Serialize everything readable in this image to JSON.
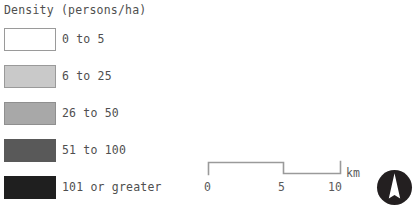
{
  "legend": {
    "title": "Density (persons/ha)",
    "classes": [
      {
        "label": "0 to 5",
        "color": "#ffffff",
        "border": "#9a9a9a"
      },
      {
        "label": "6 to 25",
        "color": "#c9c9c9",
        "border": "#9a9a9a"
      },
      {
        "label": "26 to 50",
        "color": "#a8a8a8",
        "border": "#8f8f8f"
      },
      {
        "label": "51 to 100",
        "color": "#595959",
        "border": "#595959"
      },
      {
        "label": "101 or greater",
        "color": "#1f1f1f",
        "border": "#1f1f1f"
      }
    ]
  },
  "scale_bar": {
    "ticks": [
      "0",
      "5",
      "10"
    ],
    "unit": "km",
    "line_color": "#9a9a9a"
  },
  "north_arrow": {
    "icon": "north-arrow-icon",
    "circle_color": "#231f20",
    "needle_color": "#ffffff"
  },
  "footnote": {
    "text": ""
  }
}
